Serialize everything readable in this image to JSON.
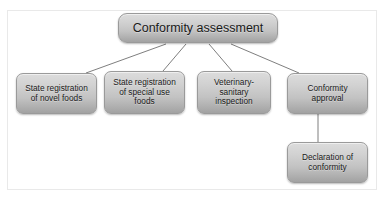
{
  "diagram": {
    "title": "Conformity assessment",
    "nodes": [
      {
        "id": "root",
        "label": "Conformity assessment"
      },
      {
        "id": "novel",
        "label": "State registration of novel foods"
      },
      {
        "id": "special",
        "label": "State registration of special use foods"
      },
      {
        "id": "vet",
        "label": "Veterinary-sanitary inspection"
      },
      {
        "id": "approval",
        "label": "Conformity approval"
      },
      {
        "id": "declaration",
        "label": "Declaration of conformity"
      }
    ],
    "edges": [
      {
        "from": "root",
        "to": "novel"
      },
      {
        "from": "root",
        "to": "special"
      },
      {
        "from": "root",
        "to": "vet"
      },
      {
        "from": "root",
        "to": "approval"
      },
      {
        "from": "approval",
        "to": "declaration"
      }
    ]
  },
  "colors": {
    "node_fill_top": "#dcdcdc",
    "node_fill_bottom": "#a2a2a2",
    "node_border": "#9a9a9a",
    "connector": "#6f6f6f",
    "frame_border": "#e9e9e9",
    "background": "#ffffff",
    "text": "#1a1a1a"
  }
}
